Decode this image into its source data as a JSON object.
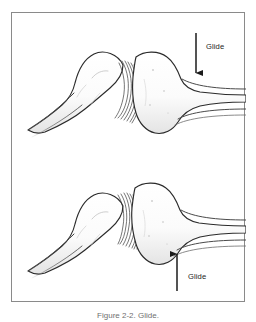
{
  "figure": {
    "caption": "Figure 2-2. Glide.",
    "frame_color": "#8a8a8a",
    "background_color": "#ffffff",
    "ink_color": "#2b2b2b",
    "shading_color": "#e9e9e9"
  },
  "annotations": {
    "top": {
      "label": "Glide",
      "arrow_direction": "down",
      "arrow_color": "#1b1b1b"
    },
    "bottom": {
      "label": "Glide",
      "arrow_direction": "up",
      "arrow_color": "#1b1b1b"
    }
  },
  "illustration": {
    "title": "Joint glide mobilization",
    "panels": [
      {
        "name": "neutral-joint",
        "description": "Two bone ends articulating with open joint space and hatched joint capsule",
        "force": "downward glide on distal bone"
      },
      {
        "name": "glided-joint",
        "description": "Distal bone translated superiorly, joint capsule compressed with dense hatching",
        "force": "upward glide on distal bone"
      }
    ]
  }
}
